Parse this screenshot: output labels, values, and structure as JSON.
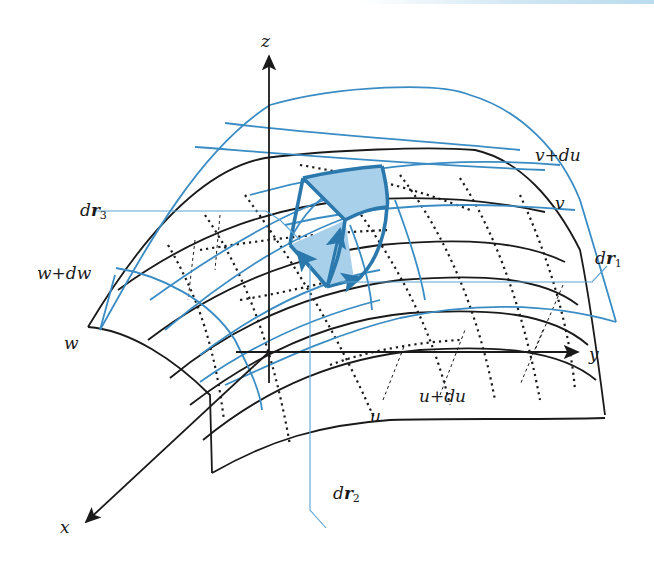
{
  "figure": {
    "colors": {
      "surface_outline": "#1a1a1a",
      "coordinate_surface_blue": "#3a8cc4",
      "volume_element_fill": "#a9d0ea",
      "volume_element_edge": "#2b78ad",
      "leader_line": "#5aa3d2"
    },
    "axes": {
      "x": "x",
      "y": "y",
      "z": "z"
    },
    "surface_labels": {
      "w": "w",
      "w_plus_dw": "w+dw",
      "u": "u",
      "u_plus_du": "u+du",
      "v": "v",
      "v_plus_dv": "v+du"
    },
    "vector_labels": {
      "dr1": {
        "base": "d",
        "bold": "r",
        "sub": "1"
      },
      "dr2": {
        "base": "d",
        "bold": "r",
        "sub": "2"
      },
      "dr3": {
        "base": "d",
        "bold": "r",
        "sub": "3"
      }
    }
  }
}
